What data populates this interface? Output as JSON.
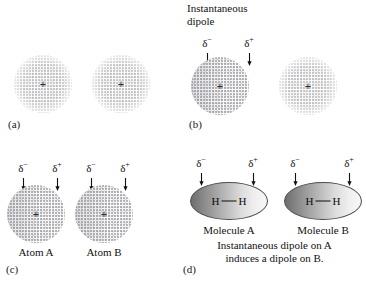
{
  "figure": {
    "background_color": "#ffffff",
    "text_color": "#111111"
  },
  "symbols": {
    "delta_negative": "δ",
    "delta_negative_sign": "−",
    "delta_positive": "δ",
    "delta_positive_sign": "+",
    "nucleus": "+",
    "hydrogen": "H",
    "arrow_down_icon": "arrow-down-icon"
  },
  "panels": [
    {
      "id": "a",
      "label": "(a)",
      "heading": "",
      "clouds": [
        {
          "name": "electron-cloud-left",
          "polarised": false,
          "nucleus": "+"
        },
        {
          "name": "electron-cloud-right",
          "polarised": false,
          "nucleus": "+"
        }
      ],
      "charges": [],
      "captions": []
    },
    {
      "id": "b",
      "label": "(b)",
      "heading_line1": "Instantaneous",
      "heading_line2": "dipole",
      "clouds": [
        {
          "name": "electron-cloud-left",
          "polarised": true,
          "nucleus": "+"
        },
        {
          "name": "electron-cloud-right",
          "polarised": false,
          "nucleus": "+"
        }
      ],
      "charges": [
        {
          "sym": "δ",
          "sign": "−"
        },
        {
          "sym": "δ",
          "sign": "+"
        }
      ],
      "captions": []
    },
    {
      "id": "c",
      "label": "(c)",
      "heading": "",
      "clouds": [
        {
          "name": "electron-cloud-atom-a",
          "polarised": true,
          "nucleus": "+"
        },
        {
          "name": "electron-cloud-atom-b",
          "polarised": true,
          "nucleus": "+"
        }
      ],
      "charges": [
        {
          "sym": "δ",
          "sign": "−"
        },
        {
          "sym": "δ",
          "sign": "+"
        },
        {
          "sym": "δ",
          "sign": "−"
        },
        {
          "sym": "δ",
          "sign": "+"
        }
      ],
      "captions": [
        {
          "name": "atom-a-label",
          "text": "Atom A"
        },
        {
          "name": "atom-b-label",
          "text": "Atom B"
        }
      ]
    },
    {
      "id": "d",
      "label": "(d)",
      "heading": "",
      "molecules": [
        {
          "name": "molecule-a",
          "left_atom": "H",
          "right_atom": "H"
        },
        {
          "name": "molecule-b",
          "left_atom": "H",
          "right_atom": "H"
        }
      ],
      "charges": [
        {
          "sym": "δ",
          "sign": "−"
        },
        {
          "sym": "δ",
          "sign": "+"
        },
        {
          "sym": "δ",
          "sign": "−"
        },
        {
          "sym": "δ",
          "sign": "+"
        }
      ],
      "captions": [
        {
          "name": "molecule-a-label",
          "text": "Molecule A"
        },
        {
          "name": "molecule-b-label",
          "text": "Molecule B"
        }
      ],
      "subcaption_line1": "Instantaneous dipole on A",
      "subcaption_line2": "induces a dipole on B."
    }
  ]
}
